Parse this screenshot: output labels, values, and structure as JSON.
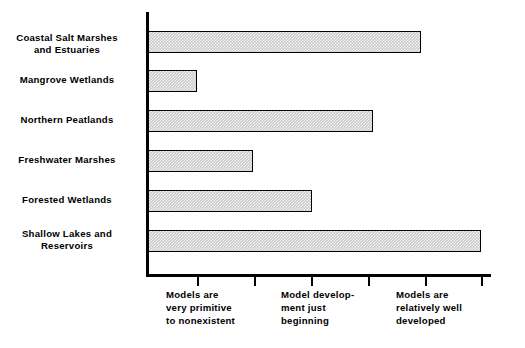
{
  "chart_data": {
    "type": "bar",
    "orientation": "horizontal",
    "title": "",
    "xlabel": "",
    "ylabel": "",
    "grid": false,
    "legend": false,
    "xlim": [
      0,
      6
    ],
    "categories": [
      "Coastal Salt Marshes\nand Estuaries",
      "Mangrove Wetlands",
      "Northern Peatlands",
      "Freshwater Marshes",
      "Forested Wetlands",
      "Shallow Lakes and\nReservoirs"
    ],
    "values": [
      4.8,
      1.0,
      3.9,
      2.0,
      3.0,
      5.85
    ],
    "axis_ticks": [
      1,
      2,
      3,
      4,
      5,
      6
    ],
    "tick_captions": [
      "Models  are\nvery  primitive\nto  nonexistent",
      "Model  develop-\nment  just\nbeginning",
      "Models  are\nrelatively  well\ndeveloped"
    ],
    "tick_caption_positions": [
      1,
      3,
      5
    ],
    "bar_fill_color": "#c9c9c9",
    "bar_edge_color": "#000000",
    "axis_color": "#000000",
    "background_color": "#ffffff"
  },
  "bars": [
    {
      "label": "Coastal Salt Marshes\nand Estuaries",
      "value": 4.8,
      "end_px": 421,
      "top_px": 31
    },
    {
      "label": "Mangrove Wetlands",
      "value": 1.0,
      "end_px": 197,
      "top_px": 70
    },
    {
      "label": "Northern Peatlands",
      "value": 3.9,
      "end_px": 373,
      "top_px": 110
    },
    {
      "label": "Freshwater Marshes",
      "value": 2.0,
      "end_px": 253,
      "top_px": 150
    },
    {
      "label": "Forested Wetlands",
      "value": 3.0,
      "end_px": 312,
      "top_px": 190
    },
    {
      "label": "Shallow Lakes and\nReservoirs",
      "value": 5.85,
      "end_px": 481,
      "top_px": 230
    }
  ],
  "ticks_px": [
    197,
    254,
    311,
    368,
    425,
    481
  ],
  "x_captions": [
    {
      "text": "Models  are\nvery  primitive\nto  nonexistent",
      "left_px": 166
    },
    {
      "text": "Model  develop-\nment  just\nbeginning",
      "left_px": 281
    },
    {
      "text": "Models  are\nrelatively  well\ndeveloped",
      "left_px": 396
    }
  ]
}
